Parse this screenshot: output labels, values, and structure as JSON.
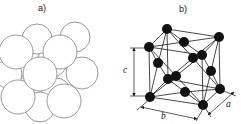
{
  "figure": {
    "panel_a": {
      "label": "a)",
      "description": "close-packed hard-sphere cluster",
      "outline_color": "#8d8d8d",
      "sphere_fill": "#ffffff",
      "spheres": [
        {
          "cx": 28,
          "cy": 62,
          "r": 15
        },
        {
          "cx": 52,
          "cy": 62,
          "r": 15
        },
        {
          "cx": 28,
          "cy": 92,
          "r": 15
        },
        {
          "cx": 56,
          "cy": 93,
          "r": 15
        },
        {
          "cx": 37,
          "cy": 39,
          "r": 15
        },
        {
          "cx": 75,
          "cy": 37,
          "r": 15
        },
        {
          "cx": 8,
          "cy": 74,
          "r": 14
        },
        {
          "cx": 82,
          "cy": 73,
          "r": 16
        },
        {
          "cx": 40,
          "cy": 107,
          "r": 15
        },
        {
          "cx": 16,
          "cy": 52,
          "r": 17
        },
        {
          "cx": 60,
          "cy": 52,
          "r": 17
        },
        {
          "cx": 18,
          "cy": 97,
          "r": 17
        },
        {
          "cx": 64,
          "cy": 101,
          "r": 17
        },
        {
          "cx": 40,
          "cy": 74,
          "r": 17
        }
      ]
    },
    "panel_b": {
      "label": "b)",
      "description": "face-centered cubic unit cell with corner and face-center atoms",
      "line_color": "#1a1a1a",
      "atom_color": "#111111",
      "atom_radius": 5,
      "atoms": {
        "BFL": [
          150,
          97
        ],
        "BFR": [
          203,
          105
        ],
        "BBR": [
          220,
          89
        ],
        "BBL": [
          168,
          79
        ],
        "TFL": [
          149,
          47
        ],
        "TFR": [
          202,
          55
        ],
        "TBR": [
          219,
          37
        ],
        "TBL": [
          167,
          29
        ],
        "CT": [
          184,
          42
        ],
        "CF": [
          176,
          76
        ],
        "CR": [
          211,
          71
        ],
        "CK": [
          193,
          58
        ],
        "CL": [
          158,
          63
        ],
        "CB": [
          185,
          92
        ]
      },
      "bonds": [
        [
          "BFL",
          "BFR"
        ],
        [
          "BFR",
          "BBR"
        ],
        [
          "BBR",
          "BBL"
        ],
        [
          "BBL",
          "BFL"
        ],
        [
          "TFL",
          "TFR"
        ],
        [
          "TFR",
          "TBR"
        ],
        [
          "TBR",
          "TBL"
        ],
        [
          "TBL",
          "TFL"
        ],
        [
          "BFL",
          "TFL"
        ],
        [
          "BFR",
          "TFR"
        ],
        [
          "BBR",
          "TBR"
        ],
        [
          "BBL",
          "TBL"
        ],
        [
          "CT",
          "TFL"
        ],
        [
          "CT",
          "TFR"
        ],
        [
          "CT",
          "TBR"
        ],
        [
          "CT",
          "TBL"
        ],
        [
          "CF",
          "TFL"
        ],
        [
          "CF",
          "TFR"
        ],
        [
          "CF",
          "BFL"
        ],
        [
          "CF",
          "BFR"
        ],
        [
          "CR",
          "TFR"
        ],
        [
          "CR",
          "TBR"
        ],
        [
          "CR",
          "BFR"
        ],
        [
          "CR",
          "BBR"
        ],
        [
          "CK",
          "TBL"
        ],
        [
          "CK",
          "TBR"
        ],
        [
          "CK",
          "BBL"
        ],
        [
          "CK",
          "BBR"
        ],
        [
          "CL",
          "TFL"
        ],
        [
          "CL",
          "TBL"
        ],
        [
          "CL",
          "BFL"
        ],
        [
          "CL",
          "BBL"
        ],
        [
          "CB",
          "BFL"
        ],
        [
          "CB",
          "BFR"
        ],
        [
          "CB",
          "BBR"
        ],
        [
          "CB",
          "BBL"
        ]
      ],
      "dimensions": [
        {
          "label": "c",
          "line": [
            134,
            96,
            134,
            48
          ],
          "ticks": [
            [
              130,
              48,
              148,
              48
            ],
            [
              130,
              96,
              148,
              96
            ]
          ]
        },
        {
          "label": "b",
          "line": [
            141,
            107,
            197,
            119
          ],
          "ticks": [
            [
              150,
              99,
              137,
              110
            ],
            [
              204,
              107,
              196,
              121
            ]
          ]
        },
        {
          "label": "a",
          "line": [
            208,
            115,
            234,
            92
          ],
          "ticks": [
            [
              204,
              106,
              211,
              117
            ],
            [
              221,
              90,
              236,
              96
            ]
          ]
        }
      ]
    }
  }
}
